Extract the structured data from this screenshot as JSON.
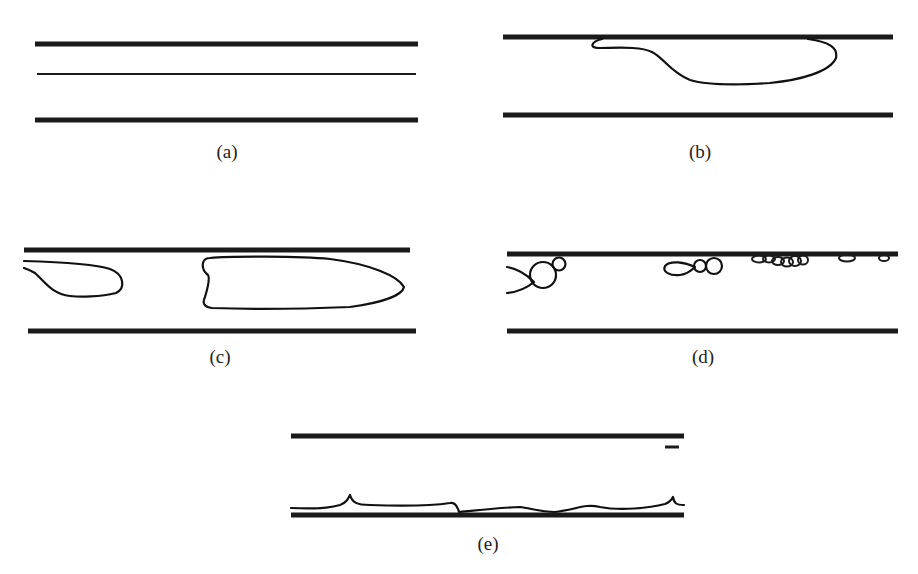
{
  "figure": {
    "panels": [
      {
        "id": "a",
        "label": "(a)",
        "description": "Stratified flow: thin interface line between two channel walls"
      },
      {
        "id": "b",
        "label": "(b)",
        "description": "Single large bubble attached to upper wall"
      },
      {
        "id": "c",
        "label": "(c)",
        "description": "Elongated slug/plug bubbles"
      },
      {
        "id": "d",
        "label": "(d)",
        "description": "Break-up into small bubbles along upper wall"
      },
      {
        "id": "e",
        "label": "(e)",
        "description": "Thin wavy film near lower wall"
      }
    ],
    "colors": {
      "wall": "#1a1a1a",
      "interface": "#111111",
      "background": "#ffffff",
      "label": "#222222"
    }
  }
}
